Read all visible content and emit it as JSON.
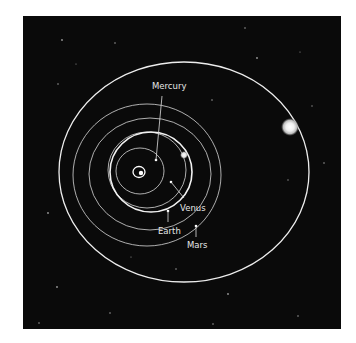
{
  "diagram": {
    "background_color": "#0a0a0a",
    "page_color": "#ffffff",
    "center_symbol": "sun-icon",
    "labels": [
      {
        "id": "mercury",
        "text": "Mercury"
      },
      {
        "id": "venus",
        "text": "Venus"
      },
      {
        "id": "earth",
        "text": "Earth"
      },
      {
        "id": "mars",
        "text": "Mars"
      }
    ],
    "orbits": [
      "Mercury",
      "Venus",
      "Earth",
      "Mars",
      "Comet"
    ],
    "comet": "large bright body on outer elliptical orbit"
  }
}
